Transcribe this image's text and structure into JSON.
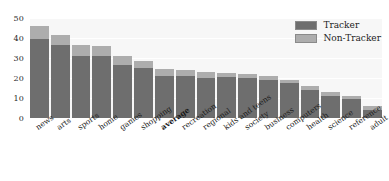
{
  "chart_data": {
    "type": "bar",
    "subtype": "stacked-vertical",
    "title": "",
    "xlabel": "",
    "ylabel": "",
    "ylim": [
      0,
      50
    ],
    "yticks": [
      0,
      10,
      20,
      30,
      40,
      50
    ],
    "grid": true,
    "grid_axis": "y",
    "legend_position": "top-right",
    "categories": [
      "news",
      "arts",
      "sports",
      "home",
      "games",
      "shopping",
      "average",
      "recreation",
      "regional",
      "kids and teens",
      "society",
      "business",
      "computers",
      "health",
      "science",
      "reference",
      "adult"
    ],
    "highlighted_category": "average",
    "series": [
      {
        "name": "Tracker",
        "color": "#6e6e6e",
        "values": [
          39.5,
          36.5,
          31,
          31,
          26.5,
          25,
          21,
          21,
          20,
          20.5,
          20,
          19,
          17.5,
          14,
          11,
          9.5,
          4
        ]
      },
      {
        "name": "Non-Tracker",
        "color": "#adadad",
        "values": [
          6.5,
          5,
          5.5,
          5,
          4.5,
          3.5,
          3.5,
          3,
          3,
          2,
          2,
          2,
          1.5,
          2,
          2,
          1.5,
          2
        ]
      }
    ],
    "totals": [
      46,
      41.5,
      36.5,
      36,
      31,
      28.5,
      24.5,
      24,
      23,
      22.5,
      22,
      21,
      19,
      16,
      13,
      11,
      6
    ]
  },
  "legend": {
    "items": [
      {
        "label": "Tracker",
        "color": "#6e6e6e"
      },
      {
        "label": "Non-Tracker",
        "color": "#adadad"
      }
    ]
  }
}
